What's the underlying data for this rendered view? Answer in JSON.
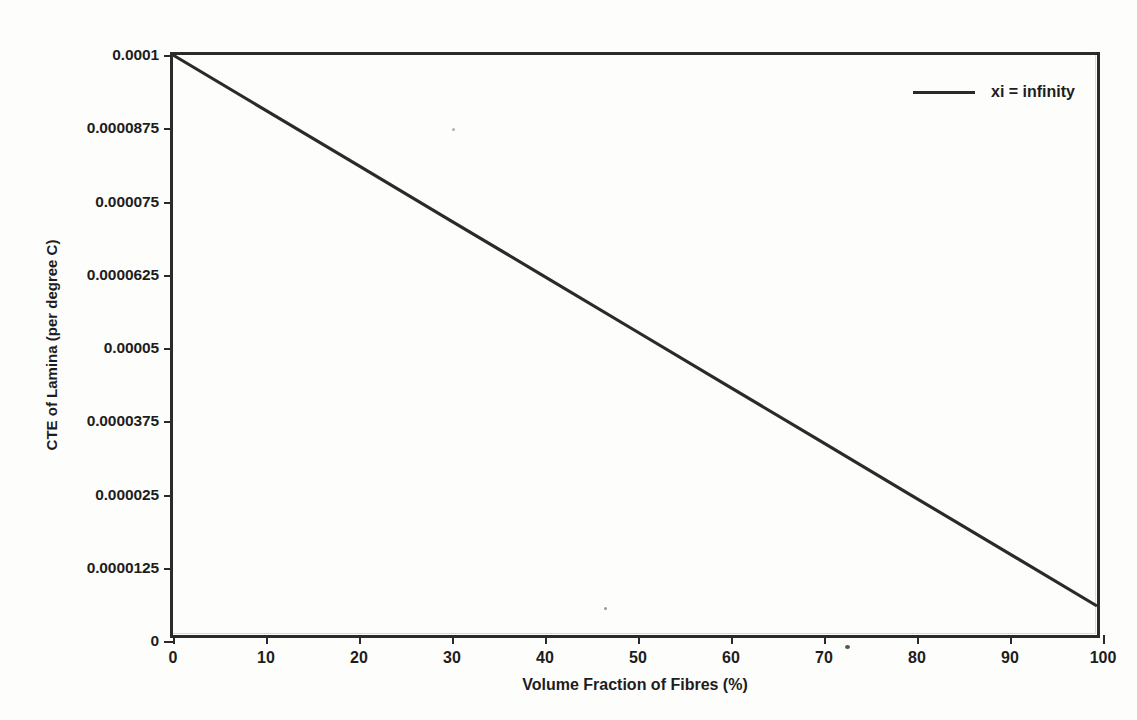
{
  "chart_data": {
    "type": "line",
    "title": "",
    "xlabel": "Volume Fraction of Fibres (%)",
    "ylabel": "CTE of Lamina (per degree C)",
    "xlim": [
      0,
      100
    ],
    "ylim": [
      0,
      0.0001
    ],
    "grid": false,
    "legend_position": "top-right",
    "x_ticks": [
      {
        "value": 0,
        "label": "0"
      },
      {
        "value": 10,
        "label": "10"
      },
      {
        "value": 20,
        "label": "20"
      },
      {
        "value": 30,
        "label": "30"
      },
      {
        "value": 40,
        "label": "40"
      },
      {
        "value": 50,
        "label": "50"
      },
      {
        "value": 60,
        "label": "60"
      },
      {
        "value": 70,
        "label": "70"
      },
      {
        "value": 80,
        "label": "80"
      },
      {
        "value": 90,
        "label": "90"
      },
      {
        "value": 100,
        "label": "100"
      }
    ],
    "y_ticks": [
      {
        "value": 0,
        "label": "0"
      },
      {
        "value": 1.25e-05,
        "label": "0.0000125"
      },
      {
        "value": 2.5e-05,
        "label": "0.000025"
      },
      {
        "value": 3.75e-05,
        "label": "0.0000375"
      },
      {
        "value": 5e-05,
        "label": "0.00005"
      },
      {
        "value": 6.25e-05,
        "label": "0.0000625"
      },
      {
        "value": 7.5e-05,
        "label": "0.000075"
      },
      {
        "value": 8.75e-05,
        "label": "0.0000875"
      },
      {
        "value": 0.0001,
        "label": "0.0001"
      }
    ],
    "series": [
      {
        "name": "xi = infinity",
        "color": "#2a2a2a",
        "x": [
          0,
          10,
          20,
          30,
          40,
          50,
          60,
          70,
          80,
          90,
          100
        ],
        "values": [
          0.0001,
          9.05e-05,
          8.1e-05,
          7.15e-05,
          6.2e-05,
          5.25e-05,
          4.3e-05,
          3.35e-05,
          2.4e-05,
          1.45e-05,
          5e-06
        ]
      }
    ]
  },
  "legend": {
    "entries": [
      {
        "label": "xi = infinity"
      }
    ]
  }
}
